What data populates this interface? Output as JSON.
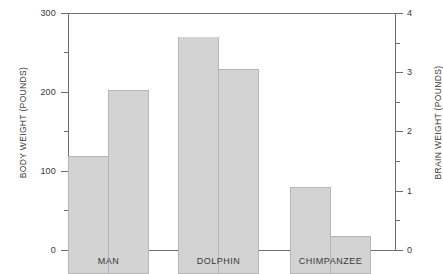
{
  "chart_data": {
    "type": "bar",
    "title": "",
    "categories": [
      "MAN",
      "DOLPHIN",
      "CHIMPANZEE"
    ],
    "series": [
      {
        "name": "Body weight",
        "axis": "left",
        "unit": "POUNDS",
        "values": [
          150,
          300,
          110
        ]
      },
      {
        "name": "Brain weight",
        "axis": "right",
        "unit": "POUNDS",
        "values": [
          3.1,
          3.46,
          0.65
        ]
      }
    ],
    "ylabel": "BODY WEIGHT (POUNDS)",
    "y2label": "BRAIN WEIGHT (POUNDS)",
    "xlabel": "",
    "ylim": [
      0,
      300
    ],
    "y2lim": [
      0,
      4
    ],
    "yticks": [
      0,
      100,
      200,
      300
    ],
    "yticks_minor": [
      50,
      150,
      250
    ],
    "y2ticks": [
      0,
      1,
      2,
      3,
      4
    ],
    "y2ticks_minor": [
      0.5,
      1.5,
      2.5,
      3.5
    ],
    "grid": false,
    "legend": "none",
    "bar_color": "#d3d3d3",
    "bar_edge_color": "#b6b6b6",
    "axis_color": "#6f6f6f",
    "text_color": "#3a3a3a"
  },
  "axes": {
    "left": {
      "title": "BODY WEIGHT (POUNDS)",
      "labels": [
        "300",
        "200",
        "100",
        "0"
      ]
    },
    "right": {
      "title": "BRAIN WEIGHT (POUNDS)",
      "labels": [
        "4",
        "3",
        "2",
        "1",
        "0"
      ]
    }
  },
  "groups": [
    {
      "label": "MAN"
    },
    {
      "label": "DOLPHIN"
    },
    {
      "label": "CHIMPANZEE"
    }
  ]
}
